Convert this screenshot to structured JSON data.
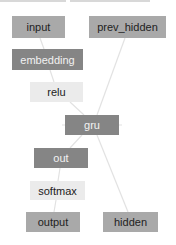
{
  "diagram": {
    "type": "computation-graph",
    "nodes": [
      {
        "id": "input",
        "label": "input",
        "style": "light"
      },
      {
        "id": "prev_hidden",
        "label": "prev_hidden",
        "style": "light"
      },
      {
        "id": "embedding",
        "label": "embedding",
        "style": "dark"
      },
      {
        "id": "relu",
        "label": "relu",
        "style": "pale"
      },
      {
        "id": "gru",
        "label": "gru",
        "style": "dark"
      },
      {
        "id": "out",
        "label": "out",
        "style": "dark"
      },
      {
        "id": "softmax",
        "label": "softmax",
        "style": "pale"
      },
      {
        "id": "output",
        "label": "output",
        "style": "light"
      },
      {
        "id": "hidden",
        "label": "hidden",
        "style": "light"
      }
    ],
    "edges": [
      [
        "input",
        "embedding"
      ],
      [
        "embedding",
        "relu"
      ],
      [
        "relu",
        "gru"
      ],
      [
        "prev_hidden",
        "gru"
      ],
      [
        "gru",
        "out"
      ],
      [
        "gru",
        "hidden"
      ],
      [
        "out",
        "softmax"
      ],
      [
        "softmax",
        "output"
      ]
    ],
    "colors": {
      "light": "#a9a9a9",
      "dark": "#858585",
      "pale": "#ebebeb",
      "edge": "#e0e0e0"
    }
  }
}
